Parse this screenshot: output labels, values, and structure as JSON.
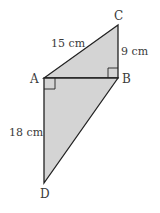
{
  "figure": {
    "type": "geometry-quadrilateral",
    "fill_color": "#d4d4d4",
    "stroke_color": "#222222",
    "vertices": {
      "A": {
        "label": "A",
        "x": 44,
        "y": 78
      },
      "B": {
        "label": "B",
        "x": 118,
        "y": 78
      },
      "C": {
        "label": "C",
        "x": 118,
        "y": 25
      },
      "D": {
        "label": "D",
        "x": 44,
        "y": 183
      }
    },
    "measurements": {
      "AC": "15 cm",
      "BC": "9 cm",
      "AD": "18 cm"
    },
    "right_angles": [
      "ABC",
      "BAD"
    ],
    "triangles": [
      "ABC",
      "ABD"
    ]
  }
}
